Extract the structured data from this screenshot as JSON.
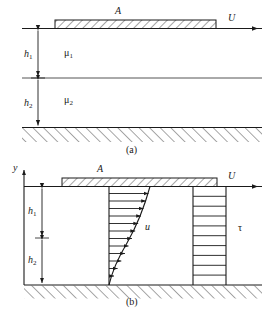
{
  "figure": {
    "panels": [
      {
        "id": "a",
        "caption": "(a)",
        "description": "Geometry: plate A on top of two immiscible fluid layers",
        "labels": {
          "plate": "A",
          "velocity": "U",
          "height_upper": "h",
          "height_upper_sub": "1",
          "height_lower": "h",
          "height_lower_sub": "2",
          "viscosity_upper": "μ",
          "viscosity_upper_sub": "1",
          "viscosity_lower": "μ",
          "viscosity_lower_sub": "2"
        }
      },
      {
        "id": "b",
        "caption": "(b)",
        "description": "Velocity profile u and shear-stress profile tau across the two layers",
        "labels": {
          "axis_y": "y",
          "plate": "A",
          "velocity": "U",
          "height_upper": "h",
          "height_upper_sub": "1",
          "height_lower": "h",
          "height_lower_sub": "2",
          "velocity_profile": "u",
          "shear_profile": "τ"
        }
      }
    ],
    "colors": {
      "line": "#1a1a1a",
      "hatch": "#3a3a3a",
      "background": "#ffffff"
    }
  }
}
